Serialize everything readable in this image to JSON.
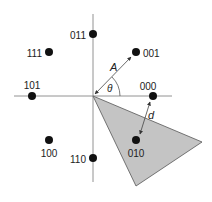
{
  "diagram": {
    "type": "8-PSK constellation",
    "axes": {
      "origin": [
        93,
        96
      ]
    },
    "points": [
      {
        "label": "000",
        "x": 153,
        "y": 96,
        "lx": 148,
        "ly": 90,
        "anchor": "middle"
      },
      {
        "label": "001",
        "x": 136,
        "y": 52,
        "lx": 143,
        "ly": 57,
        "anchor": "start"
      },
      {
        "label": "011",
        "x": 93,
        "y": 34,
        "lx": 86,
        "ly": 39,
        "anchor": "end"
      },
      {
        "label": "111",
        "x": 49,
        "y": 52,
        "lx": 42,
        "ly": 57,
        "anchor": "end"
      },
      {
        "label": "101",
        "x": 32,
        "y": 96,
        "lx": 32,
        "ly": 89,
        "anchor": "middle"
      },
      {
        "label": "100",
        "x": 49,
        "y": 140,
        "lx": 49,
        "ly": 157,
        "anchor": "middle"
      },
      {
        "label": "110",
        "x": 93,
        "y": 158,
        "lx": 86,
        "ly": 163,
        "anchor": "end"
      },
      {
        "label": "010",
        "x": 136,
        "y": 140,
        "lx": 136,
        "ly": 157,
        "anchor": "middle"
      }
    ],
    "annotations": {
      "amplitude": "A",
      "angle": "θ",
      "distance": "d"
    },
    "colors": {
      "region_fill": "#c4c4c4",
      "line": "#666666",
      "dot": "#111111"
    }
  }
}
